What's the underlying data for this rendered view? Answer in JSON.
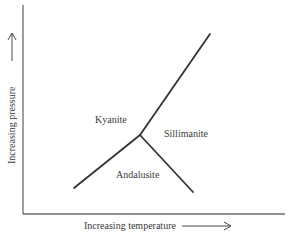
{
  "diagram": {
    "type": "phase-diagram",
    "x_axis": {
      "label": "Increasing temperature",
      "arrow": "right"
    },
    "y_axis": {
      "label": "Increasing pressure",
      "arrow": "up"
    },
    "phases": [
      {
        "name": "Kyanite",
        "region": "upper-left"
      },
      {
        "name": "Sillimanite",
        "region": "right"
      },
      {
        "name": "Andalusite",
        "region": "lower-middle"
      }
    ],
    "boundaries": [
      {
        "name": "kyanite-andalusite",
        "from": "triple-point",
        "to": "lower-left"
      },
      {
        "name": "kyanite-sillimanite",
        "from": "triple-point",
        "to": "upper-right"
      },
      {
        "name": "andalusite-sillimanite",
        "from": "triple-point",
        "to": "lower-right"
      }
    ],
    "colors": {
      "line": "#333333",
      "axis": "#6a6a6a",
      "text": "#3a3a3a",
      "background": "#ffffff"
    }
  }
}
